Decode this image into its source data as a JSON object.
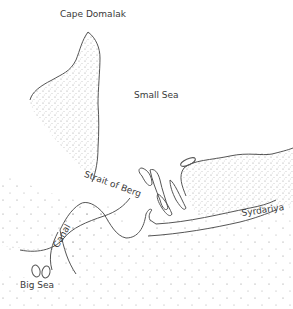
{
  "map": {
    "labels": {
      "cape": "Cape Domalak",
      "small_sea": "Small Sea",
      "strait": "Strait of Berg",
      "river": "Syrdariya",
      "canal": "Canal",
      "big_sea": "Big Sea"
    },
    "colors": {
      "coastline": "#555555",
      "stipple": "#777777",
      "text": "#3a3a3a",
      "background": "#ffffff"
    }
  }
}
